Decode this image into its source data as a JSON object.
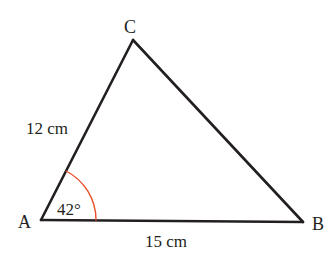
{
  "diagram": {
    "type": "triangle",
    "vertices": [
      {
        "label": "A",
        "x": 41,
        "y": 220
      },
      {
        "label": "B",
        "x": 303,
        "y": 222
      },
      {
        "label": "C",
        "x": 133,
        "y": 40
      }
    ],
    "sides": [
      {
        "from": "A",
        "to": "C",
        "label": "12 cm"
      },
      {
        "from": "A",
        "to": "B",
        "label": "15 cm"
      }
    ],
    "angles": [
      {
        "vertex": "A",
        "label": "42°",
        "arc_color": "#e8502a"
      }
    ],
    "line_color": "#231f20"
  },
  "labels": {
    "A": "A",
    "B": "B",
    "C": "C",
    "side_AC": "12 cm",
    "side_AB": "15 cm",
    "angle_A": "42°"
  }
}
